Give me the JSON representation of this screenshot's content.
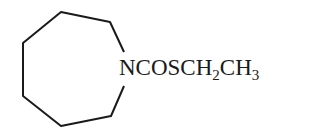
{
  "molecule": {
    "ring": {
      "type": "azepane",
      "member_count": 7,
      "heteroatom": "N",
      "vertices": [
        [
          61,
          12
        ],
        [
          110,
          22
        ],
        [
          126,
          52
        ],
        [
          126,
          85
        ],
        [
          111,
          116
        ],
        [
          61,
          126
        ],
        [
          23,
          96
        ],
        [
          23,
          43
        ]
      ]
    },
    "substituent_label": {
      "parts": [
        {
          "text": "NCOSCH",
          "sub": false
        },
        {
          "text": "2",
          "sub": true
        },
        {
          "text": "CH",
          "sub": false
        },
        {
          "text": "3",
          "sub": true
        }
      ],
      "full_text": "NCOSCH2CH3"
    },
    "colors": {
      "line": "#1a1a1a",
      "background": "#ffffff"
    }
  }
}
